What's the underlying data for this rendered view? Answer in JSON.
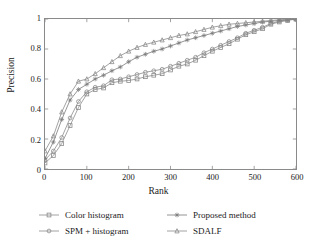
{
  "chart_data": {
    "type": "line",
    "title": "",
    "xlabel": "Rank",
    "ylabel": "Precision",
    "xlim": [
      0,
      600
    ],
    "ylim": [
      0,
      1
    ],
    "xticks": [
      "0",
      "100",
      "200",
      "300",
      "400",
      "500",
      "600"
    ],
    "yticks": [
      "0",
      "0.2",
      "0.4",
      "0.6",
      "0.8",
      "1"
    ],
    "grid": false,
    "legend_position": "below",
    "series": [
      {
        "name": "Color histogram",
        "marker": "square",
        "color": "#8a8a8a",
        "x": [
          0,
          20,
          40,
          60,
          80,
          100,
          120,
          140,
          160,
          180,
          200,
          220,
          240,
          260,
          280,
          300,
          320,
          340,
          360,
          380,
          400,
          420,
          440,
          460,
          480,
          500,
          520,
          540,
          560,
          580,
          600
        ],
        "y": [
          0.04,
          0.09,
          0.17,
          0.29,
          0.41,
          0.5,
          0.53,
          0.54,
          0.575,
          0.585,
          0.59,
          0.6,
          0.615,
          0.625,
          0.635,
          0.66,
          0.685,
          0.7,
          0.725,
          0.755,
          0.785,
          0.81,
          0.835,
          0.865,
          0.895,
          0.915,
          0.935,
          0.965,
          0.98,
          0.99,
          1.0
        ]
      },
      {
        "name": "SPM + histogram",
        "marker": "circle",
        "color": "#8a8a8a",
        "x": [
          0,
          20,
          40,
          60,
          80,
          100,
          120,
          140,
          160,
          180,
          200,
          220,
          240,
          260,
          280,
          300,
          320,
          340,
          360,
          380,
          400,
          420,
          440,
          460,
          480,
          500,
          520,
          540,
          560,
          580,
          600
        ],
        "y": [
          0.06,
          0.12,
          0.21,
          0.34,
          0.45,
          0.515,
          0.545,
          0.555,
          0.595,
          0.6,
          0.615,
          0.63,
          0.645,
          0.655,
          0.665,
          0.685,
          0.705,
          0.725,
          0.745,
          0.775,
          0.8,
          0.825,
          0.85,
          0.875,
          0.905,
          0.925,
          0.945,
          0.97,
          0.985,
          0.995,
          1.0
        ]
      },
      {
        "name": "Proposed method",
        "marker": "star",
        "color": "#7a7a7a",
        "x": [
          0,
          20,
          40,
          60,
          80,
          100,
          120,
          140,
          160,
          180,
          200,
          220,
          240,
          260,
          280,
          300,
          320,
          340,
          360,
          380,
          400,
          420,
          440,
          460,
          480,
          500,
          520,
          540,
          560,
          580,
          600
        ],
        "y": [
          0.07,
          0.18,
          0.33,
          0.46,
          0.53,
          0.565,
          0.6,
          0.625,
          0.655,
          0.68,
          0.715,
          0.745,
          0.765,
          0.785,
          0.8,
          0.82,
          0.84,
          0.86,
          0.875,
          0.89,
          0.905,
          0.92,
          0.935,
          0.95,
          0.96,
          0.97,
          0.98,
          0.985,
          0.99,
          0.995,
          1.0
        ]
      },
      {
        "name": "SDALF",
        "marker": "triangle",
        "color": "#8a8a8a",
        "x": [
          0,
          20,
          40,
          60,
          80,
          100,
          120,
          140,
          160,
          180,
          200,
          220,
          240,
          260,
          280,
          300,
          320,
          340,
          360,
          380,
          400,
          420,
          440,
          460,
          480,
          500,
          520,
          540,
          560,
          580,
          600
        ],
        "y": [
          0.12,
          0.22,
          0.38,
          0.5,
          0.585,
          0.6,
          0.635,
          0.675,
          0.715,
          0.755,
          0.785,
          0.81,
          0.83,
          0.845,
          0.86,
          0.875,
          0.89,
          0.9,
          0.915,
          0.93,
          0.945,
          0.955,
          0.965,
          0.97,
          0.975,
          0.98,
          0.985,
          0.99,
          0.995,
          0.998,
          1.0
        ]
      }
    ]
  },
  "axes": {
    "xlabel": "Rank",
    "ylabel": "Precision"
  },
  "legend": {
    "entries": [
      {
        "label": "Color histogram"
      },
      {
        "label": "Proposed method"
      },
      {
        "label": "SPM + histogram"
      },
      {
        "label": "SDALF"
      }
    ]
  }
}
